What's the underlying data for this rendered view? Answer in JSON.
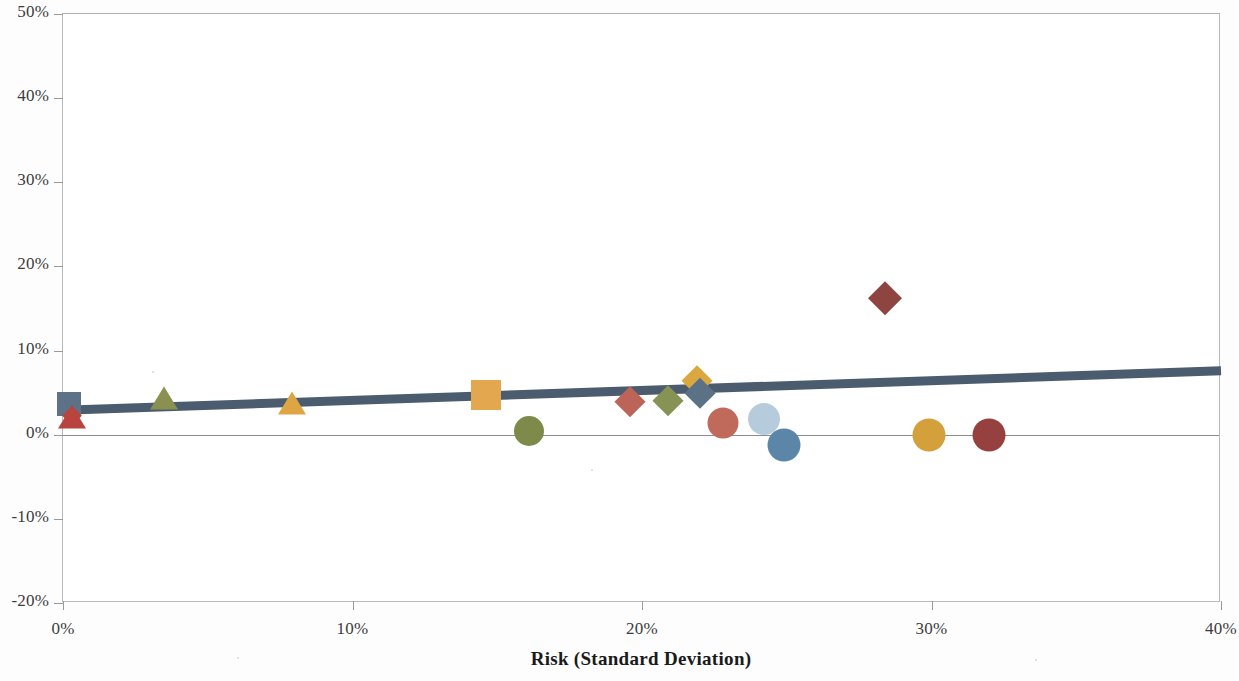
{
  "chart_data": {
    "type": "scatter",
    "title": "",
    "xlabel": "Risk (Standard Deviation)",
    "ylabel": "",
    "xlim": [
      0,
      40
    ],
    "ylim": [
      -20,
      50
    ],
    "grid": false,
    "legend": "none",
    "x_ticks": [
      "0%",
      "10%",
      "20%",
      "30%",
      "40%"
    ],
    "x_tick_values": [
      0,
      10,
      20,
      30,
      40
    ],
    "y_ticks": [
      "50%",
      "40%",
      "30%",
      "20%",
      "10%",
      "0%",
      "-10%",
      "-20%"
    ],
    "y_tick_values": [
      50,
      40,
      30,
      20,
      10,
      0,
      -10,
      -20
    ],
    "zero_line": 0,
    "trendline": {
      "name": "trend",
      "color": "#4a5c6e",
      "width": 9,
      "x0": 0,
      "y0": 2.9,
      "x1": 40,
      "y1": 7.6
    },
    "points": [
      {
        "label": "point-1",
        "x": 0.2,
        "y": 3.6,
        "shape": "square",
        "color": "#5e7287",
        "size": 24
      },
      {
        "label": "point-2",
        "x": 0.3,
        "y": 2.6,
        "shape": "triangle",
        "color": "#b9443f",
        "size": 26
      },
      {
        "label": "point-3",
        "x": 0.3,
        "y": 2.2,
        "shape": "diamond",
        "color": "#b9443f",
        "size": 20
      },
      {
        "label": "point-4",
        "x": 3.5,
        "y": 4.9,
        "shape": "triangle",
        "color": "#8a9150",
        "size": 26
      },
      {
        "label": "point-5",
        "x": 7.9,
        "y": 4.3,
        "shape": "triangle",
        "color": "#dda544",
        "size": 26
      },
      {
        "label": "point-6",
        "x": 14.6,
        "y": 4.7,
        "shape": "square",
        "color": "#e3a84f",
        "size": 30
      },
      {
        "label": "point-7",
        "x": 16.1,
        "y": 0.5,
        "shape": "circle",
        "color": "#7d8a4a",
        "size": 30
      },
      {
        "label": "point-8",
        "x": 19.6,
        "y": 3.9,
        "shape": "diamond",
        "color": "#bd6459",
        "size": 31
      },
      {
        "label": "point-9",
        "x": 20.9,
        "y": 4.0,
        "shape": "diamond",
        "color": "#869355",
        "size": 31
      },
      {
        "label": "point-10",
        "x": 21.9,
        "y": 6.4,
        "shape": "diamond",
        "color": "#d9a83f",
        "size": 31
      },
      {
        "label": "point-11",
        "x": 22.0,
        "y": 4.9,
        "shape": "diamond",
        "color": "#5b7186",
        "size": 30
      },
      {
        "label": "point-12",
        "x": 22.8,
        "y": 1.4,
        "shape": "circle",
        "color": "#c06a5c",
        "size": 31
      },
      {
        "label": "point-13",
        "x": 24.2,
        "y": 1.9,
        "shape": "circle",
        "color": "#b6ccdd",
        "size": 32
      },
      {
        "label": "point-14",
        "x": 24.9,
        "y": -1.2,
        "shape": "circle",
        "color": "#5b86a8",
        "size": 33
      },
      {
        "label": "point-15",
        "x": 28.4,
        "y": 16.3,
        "shape": "diamond",
        "color": "#8e4440",
        "size": 33
      },
      {
        "label": "point-16",
        "x": 29.9,
        "y": 0.0,
        "shape": "circle",
        "color": "#d3a03b",
        "size": 33
      },
      {
        "label": "point-17",
        "x": 32.0,
        "y": 0.0,
        "shape": "circle",
        "color": "#96403f",
        "size": 33
      }
    ]
  },
  "axis": {
    "x_title": "Risk (Standard Deviation)"
  }
}
